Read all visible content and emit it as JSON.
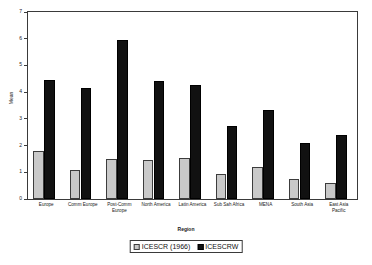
{
  "chart_data": {
    "type": "bar",
    "title": "",
    "xlabel": "Region",
    "ylabel": "Mean",
    "ylim": [
      0,
      7
    ],
    "yticks": [
      0,
      1,
      2,
      3,
      4,
      5,
      6,
      7
    ],
    "ytick_labels": [
      "0",
      "1",
      "2",
      "3",
      "4",
      "5",
      "6",
      "7"
    ],
    "grid": false,
    "legend_position": "bottom-center",
    "categories": [
      "Europe",
      "Comm Europe",
      "Post-Comm Europe",
      "North America",
      "Latin America",
      "Sub Sah Africa",
      "MENA",
      "South Asia",
      "East Asia Pacific"
    ],
    "category_lines": [
      [
        "Europe"
      ],
      [
        "Comm Europe"
      ],
      [
        "Post-Comm",
        "Europe"
      ],
      [
        "North America"
      ],
      [
        "Latin America"
      ],
      [
        "Sub Sah Africa"
      ],
      [
        "MENA"
      ],
      [
        "South Asia"
      ],
      [
        "East Asia",
        "Pacific"
      ]
    ],
    "series": [
      {
        "name": "ICESCR (1966)",
        "color": "#c9c9c9",
        "values": [
          1.8,
          1.1,
          1.5,
          1.45,
          1.55,
          0.95,
          1.2,
          0.75,
          0.6
        ]
      },
      {
        "name": "ICESCRW",
        "color": "#111111",
        "values": [
          4.45,
          4.15,
          5.95,
          4.4,
          4.25,
          2.75,
          3.35,
          2.1,
          2.4
        ]
      }
    ]
  },
  "axis": {
    "y_title": "Mean",
    "x_title": "Region"
  },
  "legend": {
    "entries": [
      {
        "label": "ICESCR (1966)",
        "swatch": "light-gray-square"
      },
      {
        "label": "ICESCRW",
        "swatch": "black-square"
      }
    ]
  }
}
